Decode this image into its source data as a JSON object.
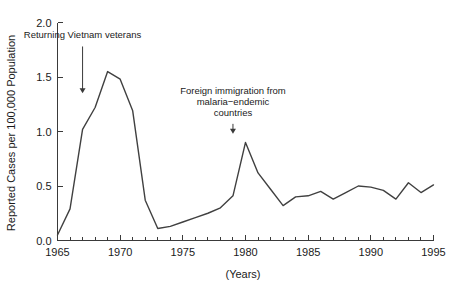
{
  "chart_data": {
    "type": "line",
    "title": "",
    "xlabel": "(Years)",
    "ylabel": "Reported Cases per 100,000 Population",
    "xlim": [
      1965,
      1995
    ],
    "ylim": [
      0.0,
      2.0
    ],
    "grid": false,
    "legend": "none",
    "y_ticks": [
      "0.0",
      "0.5",
      "1.0",
      "1.5",
      "2.0"
    ],
    "y_tick_values": [
      0.0,
      0.5,
      1.0,
      1.5,
      2.0
    ],
    "x_ticks": [
      "1965",
      "1970",
      "1975",
      "1980",
      "1985",
      "1990",
      "1995"
    ],
    "x_tick_values": [
      1965,
      1970,
      1975,
      1980,
      1985,
      1990,
      1995
    ],
    "x_minor_tick_step": 1,
    "line_color": "#404040",
    "x": [
      1965,
      1966,
      1967,
      1968,
      1969,
      1970,
      1971,
      1972,
      1973,
      1974,
      1975,
      1976,
      1977,
      1978,
      1979,
      1980,
      1981,
      1982,
      1983,
      1984,
      1985,
      1986,
      1987,
      1988,
      1989,
      1990,
      1991,
      1992,
      1993,
      1994,
      1995
    ],
    "values": [
      0.05,
      0.29,
      1.02,
      1.22,
      1.55,
      1.48,
      1.19,
      0.37,
      0.11,
      0.13,
      0.17,
      0.21,
      0.25,
      0.3,
      0.41,
      0.9,
      0.62,
      0.47,
      0.32,
      0.4,
      0.41,
      0.45,
      0.38,
      0.44,
      0.5,
      0.49,
      0.46,
      0.38,
      0.53,
      0.44,
      0.51
    ],
    "annotations": [
      {
        "id": "vietnam-veterans",
        "lines": [
          "Returning Vietnam veterans"
        ],
        "text": "Returning Vietnam veterans",
        "arrow_year": 1967,
        "arrow_from_value": 1.78,
        "arrow_to_value": 1.35
      },
      {
        "id": "foreign-immigration",
        "lines": [
          "Foreign immigration from",
          "malaria−endemic",
          "countries"
        ],
        "text": "Foreign immigration from malaria−endemic countries",
        "arrow_year": 1979,
        "arrow_from_value": 1.07,
        "arrow_to_value": 0.98
      }
    ]
  }
}
